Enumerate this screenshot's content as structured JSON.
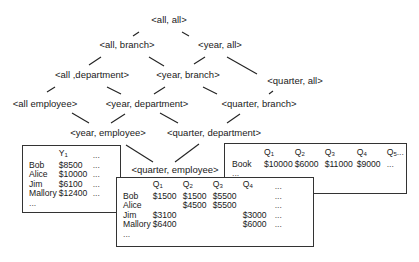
{
  "lattice": {
    "nodes": [
      {
        "id": "all-all",
        "label": "<all, all>"
      },
      {
        "id": "all-branch",
        "label": "<all, branch>"
      },
      {
        "id": "year-all",
        "label": "<year, all>"
      },
      {
        "id": "all-department",
        "label": "<all ,department>"
      },
      {
        "id": "year-branch",
        "label": "<year, branch>"
      },
      {
        "id": "quarter-all",
        "label": "<quarter, all>"
      },
      {
        "id": "all-employee",
        "label": "<all employee>"
      },
      {
        "id": "year-department",
        "label": "<year, department>"
      },
      {
        "id": "quarter-branch",
        "label": "<quarter, branch>"
      },
      {
        "id": "year-employee",
        "label": "<year, employee>"
      },
      {
        "id": "quarter-department",
        "label": "<quarter, department>"
      },
      {
        "id": "quarter-employee",
        "label": "<quarter, employee>"
      }
    ]
  },
  "tables": {
    "year_employee": {
      "headers": [
        "",
        "Y",
        "1",
        "..."
      ],
      "rows": [
        {
          "name": "Bob",
          "y1": "$8500",
          "more": "..."
        },
        {
          "name": "Alice",
          "y1": "$10000",
          "more": "..."
        },
        {
          "name": "Jim",
          "y1": "$6100",
          "more": "..."
        },
        {
          "name": "Mallory",
          "y1": "$12400",
          "more": "..."
        }
      ],
      "ellipsis": "..."
    },
    "quarter_department": {
      "headers": [
        {
          "q": "Q",
          "sub": "1"
        },
        {
          "q": "Q",
          "sub": "2"
        },
        {
          "q": "Q",
          "sub": "3"
        },
        {
          "q": "Q",
          "sub": "4"
        },
        {
          "q": "Q",
          "sub": "5"
        }
      ],
      "header_more": "...",
      "rows": [
        {
          "name": "Book",
          "q1": "$10000",
          "q2": "$6000",
          "q3": "$11000",
          "q4": "$9000",
          "more": "..."
        }
      ],
      "ellipsis": "..."
    },
    "quarter_employee": {
      "headers": [
        {
          "q": "Q",
          "sub": "1"
        },
        {
          "q": "Q",
          "sub": "2"
        },
        {
          "q": "Q",
          "sub": "3"
        },
        {
          "q": "Q",
          "sub": "4"
        }
      ],
      "header_more": "...",
      "rows": [
        {
          "name": "Bob",
          "q1": "$1500",
          "q2": "$1500",
          "q3": "$5500",
          "q4": "",
          "more": "..."
        },
        {
          "name": "Alice",
          "q1": "",
          "q2": "$4500",
          "q3": "$5500",
          "q4": "",
          "more": "..."
        },
        {
          "name": "Jim",
          "q1": "$3100",
          "q2": "",
          "q3": "",
          "q4": "$3000",
          "more": "..."
        },
        {
          "name": "Mallory",
          "q1": "$6400",
          "q2": "",
          "q3": "",
          "q4": "$6000",
          "more": "..."
        }
      ],
      "ellipsis": "..."
    }
  }
}
